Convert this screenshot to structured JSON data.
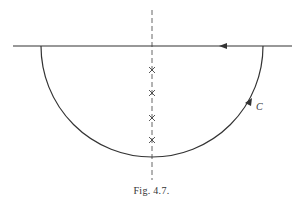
{
  "figure": {
    "caption": "Fig. 4.7.",
    "contour_label": "C",
    "elements": {
      "real_axis": {
        "x1": 13,
        "x2": 292,
        "y": 46,
        "arrow_direction": "left"
      },
      "semicircle": {
        "center_x": 152,
        "center_y": 46,
        "radius": 111,
        "half": "lower",
        "arrow_direction": "counterclockwise"
      },
      "imaginary_axis": {
        "x": 152,
        "y1": 10,
        "y2": 180,
        "style": "dashed"
      },
      "poles": [
        {
          "marker": "x",
          "y": 70
        },
        {
          "marker": "x",
          "y": 93
        },
        {
          "marker": "x",
          "y": 118
        },
        {
          "marker": "x",
          "y": 140
        }
      ]
    },
    "colors": {
      "stroke": "#333333",
      "background": "#ffffff"
    }
  }
}
